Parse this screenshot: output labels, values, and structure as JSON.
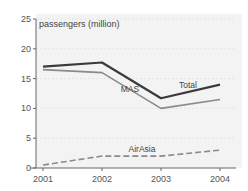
{
  "chart_data": {
    "type": "line",
    "title": "",
    "ylabel": "passengers (million)",
    "xlabel": "",
    "x": [
      "2001",
      "2002",
      "2003",
      "2004"
    ],
    "ylim": [
      0,
      25
    ],
    "yticks": [
      0,
      5,
      10,
      15,
      20,
      25
    ],
    "grid": true,
    "legend": "inline-labels",
    "series": [
      {
        "name": "Total",
        "label": "Total",
        "values": [
          17,
          17.7,
          11.7,
          14
        ],
        "color": "#3a3a3a",
        "style": "solid-thick"
      },
      {
        "name": "MAS",
        "label": "MAS",
        "values": [
          16.5,
          16,
          10,
          11.5
        ],
        "color": "#8a8a8a",
        "style": "solid"
      },
      {
        "name": "AirAsia",
        "label": "AirAsia",
        "values": [
          0.5,
          2,
          2,
          3
        ],
        "color": "#8a8a8a",
        "style": "dashed"
      }
    ]
  }
}
